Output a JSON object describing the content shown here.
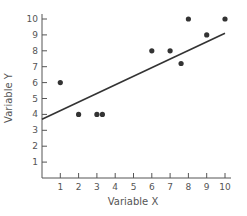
{
  "chart_data": {
    "type": "scatter",
    "title": "",
    "xlabel": "Variable X",
    "ylabel": "Variable Y",
    "xlim": [
      0,
      10
    ],
    "ylim": [
      0,
      10
    ],
    "x_ticks": [
      1,
      2,
      3,
      4,
      5,
      6,
      7,
      8,
      9,
      10
    ],
    "y_ticks": [
      1,
      2,
      3,
      4,
      5,
      6,
      7,
      8,
      9,
      10
    ],
    "grid": false,
    "legend": null,
    "series": [
      {
        "name": "observations",
        "points": [
          {
            "x": 1,
            "y": 6
          },
          {
            "x": 2,
            "y": 4
          },
          {
            "x": 3,
            "y": 4
          },
          {
            "x": 3.3,
            "y": 4
          },
          {
            "x": 6,
            "y": 8
          },
          {
            "x": 7,
            "y": 8
          },
          {
            "x": 7.6,
            "y": 7.2
          },
          {
            "x": 8,
            "y": 10
          },
          {
            "x": 9,
            "y": 9
          },
          {
            "x": 10,
            "y": 10
          }
        ]
      }
    ],
    "regression_line": {
      "x0": 0,
      "y0": 3.7,
      "x1": 10,
      "y1": 9.1
    }
  },
  "colors": {
    "axis": "#555555",
    "point": "#333333",
    "line": "#333333",
    "text": "#555555"
  }
}
